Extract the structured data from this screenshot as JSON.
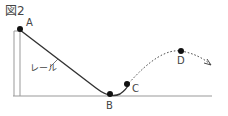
{
  "figure": {
    "title": "図2",
    "rail_label": "レール",
    "points": [
      {
        "id": "A",
        "label": "A"
      },
      {
        "id": "B",
        "label": "B"
      },
      {
        "id": "C",
        "label": "C"
      },
      {
        "id": "D",
        "label": "D"
      }
    ],
    "colors": {
      "line": "#333333",
      "ground": "#999999",
      "ball": "#111111"
    }
  }
}
